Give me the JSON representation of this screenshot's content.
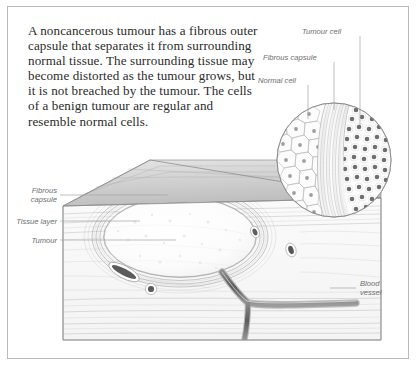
{
  "figure": {
    "kind": "medical-illustration",
    "frame": {
      "border_color": "#b9b9b9",
      "background": "#ffffff"
    }
  },
  "body_text": "A noncancerous tumour has a fibrous outer\ncapsule that separates it from surrounding\nnormal tissue. The surrounding tissue may\nbecome distorted as the tumour grows, but\nit is not breached by the tumour. The cells\nof a benign tumour are regular and\nresemble normal cells.",
  "labels": {
    "tumour_cell": "Tumour cell",
    "fibrous_capsule_inset": "Fibrous capsule",
    "normal_cell": "Normal cell",
    "fibrous_capsule_block": "Fibrous\ncapsule",
    "tissue_layer": "Tissue layer",
    "tumour": "Tumour",
    "blood_vessel": "Blood\nvessel"
  },
  "colors": {
    "label_text": "#6d6d6d",
    "body_text": "#2b2b2b",
    "leader_line": "#9a9a9a",
    "ink": "#7e7e7e",
    "ink_dark": "#4a4a4a",
    "tissue_fill": "#fbfbfb",
    "top_surface": "#d8d8d8",
    "tumour_fill": "#fdfdfd",
    "vessel_fill": "#6f6f6f"
  },
  "illustration": {
    "inset_circle": {
      "center_x": 334,
      "center_y": 160,
      "radius": 57,
      "zones": [
        {
          "name": "normal-cell-zone",
          "description": "large irregular polygonal cells with nuclei"
        },
        {
          "name": "fibrous-capsule-band",
          "description": "wavy fibrous collagen band"
        },
        {
          "name": "tumour-cell-zone",
          "description": "small dense uniform round cells"
        }
      ]
    },
    "tissue_block": {
      "description": "3D cut block of tissue with angled top surface and layered front face",
      "tumour_mass": {
        "center_x": 180,
        "center_y": 237,
        "rx": 76,
        "ry": 40
      },
      "vessels": [
        {
          "name": "vessel-oval-upper",
          "x": 255,
          "y": 232
        },
        {
          "name": "vessel-oval-right",
          "x": 291,
          "y": 250
        },
        {
          "name": "vessel-elongated",
          "x": 124,
          "y": 272
        },
        {
          "name": "vessel-round-lower",
          "x": 151,
          "y": 288
        },
        {
          "name": "vessel-branch",
          "x": 250,
          "y": 300
        }
      ]
    }
  }
}
